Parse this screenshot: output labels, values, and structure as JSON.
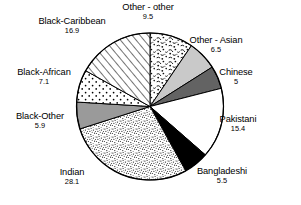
{
  "chart_data": {
    "type": "pie",
    "title": "",
    "subtitle": "",
    "xlabel": "",
    "ylabel": "",
    "legend_position": "none",
    "grid": false,
    "units": "percent",
    "total": 100.0,
    "start_angle_deg": 0,
    "direction": "clockwise",
    "categories": [
      "Other - other",
      "Other - Asian",
      "Chinese",
      "Pakistani",
      "Bangladeshi",
      "Indian",
      "Black-Other",
      "Black-African",
      "Black-Caribbean"
    ],
    "values": [
      9.5,
      6.5,
      5,
      15.4,
      5.5,
      28.1,
      5.9,
      7.1,
      16.9
    ],
    "slices": [
      {
        "label": "Other - other",
        "value": 9.5,
        "value_text": "9.5",
        "fill": "speckle-coarse",
        "color": "#ffffff",
        "label_x": 148,
        "label_y": 2,
        "label_anchor": "center"
      },
      {
        "label": "Other - Asian",
        "value": 6.5,
        "value_text": "6.5",
        "fill": "solid-light-gray",
        "color": "#c9c9c9",
        "label_x": 216,
        "label_y": 35,
        "label_anchor": "center"
      },
      {
        "label": "Chinese",
        "value": 5,
        "value_text": "5",
        "fill": "solid-dark-gray",
        "color": "#636363",
        "label_x": 236,
        "label_y": 67,
        "label_anchor": "center"
      },
      {
        "label": "Pakistani",
        "value": 15.4,
        "value_text": "15.4",
        "fill": "solid-white",
        "color": "#ffffff",
        "label_x": 238,
        "label_y": 114,
        "label_anchor": "center"
      },
      {
        "label": "Bangladeshi",
        "value": 5.5,
        "value_text": "5.5",
        "fill": "solid-black",
        "color": "#000000",
        "label_x": 222,
        "label_y": 166,
        "label_anchor": "center"
      },
      {
        "label": "Indian",
        "value": 28.1,
        "value_text": "28.1",
        "fill": "speckle-dense",
        "color": "#ffffff",
        "label_x": 72,
        "label_y": 167,
        "label_anchor": "center"
      },
      {
        "label": "Black-Other",
        "value": 5.9,
        "value_text": "5.9",
        "fill": "solid-mid-gray",
        "color": "#9a9a9a",
        "label_x": 40,
        "label_y": 111,
        "label_anchor": "center"
      },
      {
        "label": "Black-African",
        "value": 7.1,
        "value_text": "7.1",
        "fill": "dots-sparse",
        "color": "#ffffff",
        "label_x": 44,
        "label_y": 67,
        "label_anchor": "center"
      },
      {
        "label": "Black-Caribbean",
        "value": 16.9,
        "value_text": "16.9",
        "fill": "diagonal-hatch",
        "color": "#ffffff",
        "label_x": 72,
        "label_y": 16,
        "label_anchor": "center"
      }
    ],
    "geometry": {
      "center_x": 150,
      "center_y": 106.5,
      "radius": 73.5,
      "stroke": "#000000",
      "stroke_width": 1
    }
  }
}
